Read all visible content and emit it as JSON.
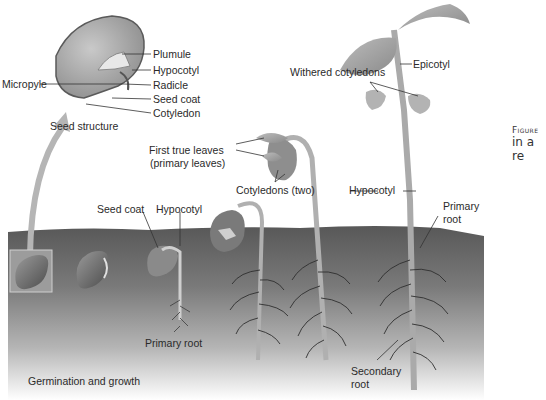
{
  "figure": {
    "caption_heading": "Figure",
    "caption_fragment": "in a re",
    "section_title": "Germination and growth",
    "colors": {
      "soil_dark": "#5a5a5a",
      "soil_light": "#d8d8d8",
      "seed": "#6e6e6e",
      "plant": "#a9a9a9",
      "arrow": "#b5b5b5",
      "label_text": "#2a2a2a"
    }
  },
  "seed_structure": {
    "title": "Seed structure",
    "labels": {
      "plumule": "Plumule",
      "hypocotyl": "Hypocotyl",
      "micropyle": "Micropyle",
      "radicle": "Radicle",
      "seed_coat": "Seed coat",
      "cotyledon": "Cotyledon"
    }
  },
  "stages": {
    "stage3": {
      "seed_coat": "Seed coat",
      "hypocotyl": "Hypocotyl",
      "primary_root": "Primary root"
    },
    "stage5": {
      "first_true_leaves_line1": "First true leaves",
      "first_true_leaves_line2": "(primary leaves)",
      "cotyledons": "Cotyledons (two)",
      "hypocotyl": "Hypocotyl"
    },
    "stage6": {
      "withered_cotyledons": "Withered cotyledons",
      "epicotyl": "Epicotyl",
      "primary_root_line1": "Primary",
      "primary_root_line2": "root",
      "secondary_root_line1": "Secondary",
      "secondary_root_line2": "root"
    }
  }
}
